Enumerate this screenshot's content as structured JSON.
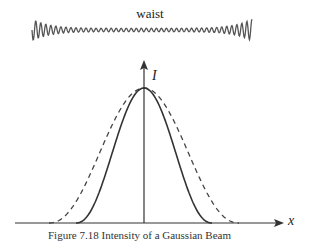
{
  "diagram": {
    "wave_label": "waist",
    "y_axis_label": "I",
    "x_axis_label": "x",
    "caption": "Figure 7.18 Intensity of a Gaussian Beam",
    "curves": [
      {
        "name": "intensity-at-waist",
        "style": "solid"
      },
      {
        "name": "intensity-away-from-waist",
        "style": "dashed"
      }
    ],
    "colors": {
      "line": "#333333",
      "wave": "#555555"
    }
  }
}
